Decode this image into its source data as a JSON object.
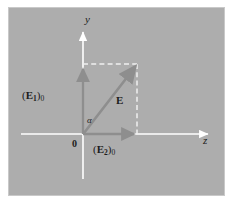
{
  "figure": {
    "panel": {
      "background_color": "#adadad",
      "border_color": "#c9c9c9"
    },
    "colors": {
      "axis": "#ffffff",
      "vector": "#8e8e8e",
      "dashed": "#efefef",
      "text": "#1c1c1c"
    },
    "axes": {
      "y_label": "y",
      "z_label": "z",
      "origin_label": "0"
    },
    "labels": {
      "component_y_prefix": "(",
      "component_y_symbol": "E",
      "component_y_sub": "1",
      "component_y_suffix": ")",
      "component_y_zero": "0",
      "component_z_symbol": "E",
      "component_z_sub": "2",
      "component_z_zero": "0",
      "resultant": "E",
      "angle": "α"
    },
    "geometry": {
      "origin": [
        82,
        133
      ],
      "y_axis_top": [
        82,
        27
      ],
      "y_axis_bottom": [
        82,
        178
      ],
      "z_axis_left": [
        20,
        133
      ],
      "z_axis_right": [
        205,
        133
      ],
      "resultant_tip": [
        136,
        64
      ],
      "component_y_tip": [
        82,
        66
      ],
      "component_z_tip": [
        136,
        133
      ],
      "rect_corner": [
        136,
        64
      ]
    }
  }
}
